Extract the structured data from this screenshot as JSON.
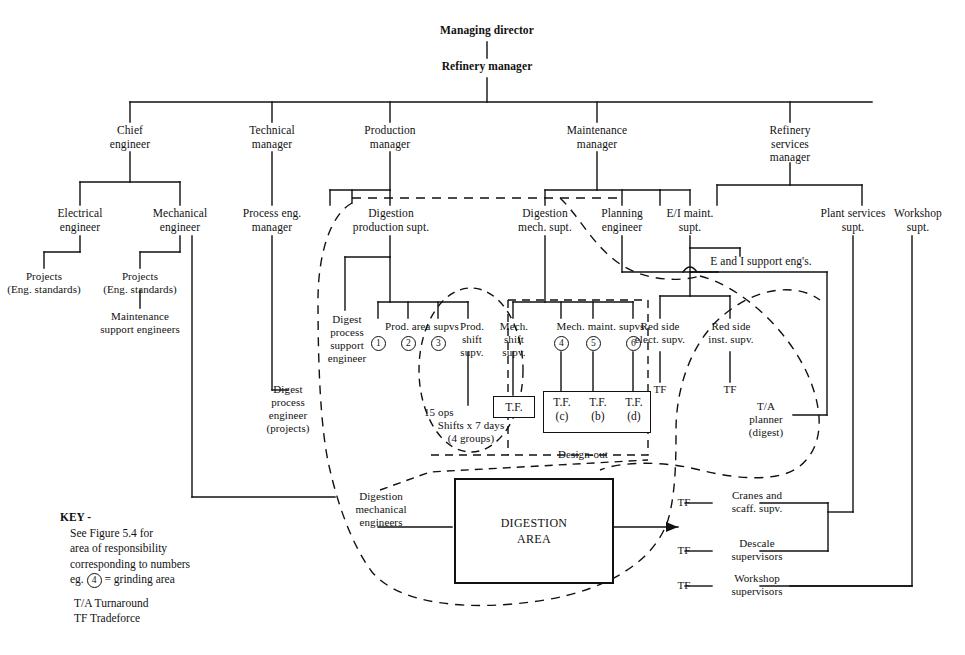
{
  "figure": {
    "top": [
      {
        "id": "managing-director",
        "label": "Managing director"
      },
      {
        "id": "refinery-manager",
        "label": "Refinery manager"
      }
    ],
    "managers": [
      {
        "id": "chief-engineer",
        "l1": "Chief",
        "l2": "engineer"
      },
      {
        "id": "technical-manager",
        "l1": "Technical",
        "l2": "manager"
      },
      {
        "id": "production-manager",
        "l1": "Production",
        "l2": "manager"
      },
      {
        "id": "maintenance-manager",
        "l1": "Maintenance",
        "l2": "manager"
      },
      {
        "id": "refinery-services-manager",
        "l1": "Refinery",
        "l2": "services",
        "l3": "manager"
      }
    ],
    "engineering": [
      {
        "id": "electrical-engineer",
        "l1": "Electrical",
        "l2": "engineer"
      },
      {
        "id": "mechanical-engineer",
        "l1": "Mechanical",
        "l2": "engineer"
      },
      {
        "id": "process-eng-manager",
        "l1": "Process eng.",
        "l2": "manager"
      }
    ],
    "projects": [
      {
        "id": "projects-electrical",
        "l1": "Projects",
        "l2": "(Eng. standards)"
      },
      {
        "id": "projects-mechanical",
        "l1": "Projects",
        "l2": "(Eng. standards)"
      }
    ],
    "maintenance_support": {
      "id": "maintenance-support-engineers",
      "l1": "Maintenance",
      "l2": "support engineers"
    },
    "digest_process_engineer_projects": {
      "l1": "Digest",
      "l2": "process",
      "l3": "engineer",
      "l4": "(projects)"
    },
    "supts": [
      {
        "id": "digestion-production-supt",
        "l1": "Digestion",
        "l2": "production supt."
      },
      {
        "id": "digestion-mech-supt",
        "l1": "Digestion",
        "l2": "mech. supt."
      },
      {
        "id": "planning-engineer",
        "l1": "Planning",
        "l2": "engineer"
      },
      {
        "id": "ei-maint-supt",
        "l1": "E/I maint.",
        "l2": "supt."
      },
      {
        "id": "plant-services-supt",
        "l1": "Plant services",
        "l2": "supt."
      },
      {
        "id": "workshop-supt",
        "l1": "Workshop",
        "l2": "supt."
      }
    ],
    "e_and_i_support": {
      "id": "e-and-i-support-engs",
      "label": "E and I support eng's."
    },
    "digest_process_support_engineer": {
      "l1": "Digest",
      "l2": "process",
      "l3": "support",
      "l4": "engineer"
    },
    "prod_area_supvs": {
      "label": "Prod. area supvs",
      "numbers": [
        "1",
        "2",
        "3"
      ]
    },
    "mech_maint_supvs": {
      "label": "Mech. maint. supvs",
      "numbers": [
        "4",
        "5",
        "6"
      ]
    },
    "prod_shift_supv": {
      "l1": "Prod.",
      "l2": "shift",
      "l3": "supv."
    },
    "mech_shift_supv": {
      "l1": "Mech.",
      "l2": "shift",
      "l3": "supv."
    },
    "ops_note": {
      "l1": "15 ops",
      "l2": "Shifts x 7 days",
      "l3": "(4 groups)"
    },
    "tf_single": {
      "label": "T.F."
    },
    "tf_group": [
      {
        "top": "T.F.",
        "bottom": "(c)"
      },
      {
        "top": "T.F.",
        "bottom": "(b)"
      },
      {
        "top": "T.F.",
        "bottom": "(d)"
      }
    ],
    "design_out": {
      "label": "Design-out"
    },
    "red_side": [
      {
        "id": "red-side-elect-supv",
        "l1": "Red side",
        "l2": "elect. supv.",
        "tf": "TF"
      },
      {
        "id": "red-side-inst-supv",
        "l1": "Red side",
        "l2": "inst. supv.",
        "tf": "TF"
      }
    ],
    "ta_planner": {
      "l1": "T/A",
      "l2": "planner",
      "l3": "(digest)"
    },
    "digestion_mech_engineers": {
      "l1": "Digestion",
      "l2": "mechanical",
      "l3": "engineers"
    },
    "digestion_area": {
      "l1": "DIGESTION",
      "l2": "AREA"
    },
    "services_rows": [
      {
        "id": "cranes-and-scaff-supv",
        "tf": "TF",
        "l1": "Cranes and",
        "l2": "scaff. supv."
      },
      {
        "id": "descale-supervisors",
        "tf": "TF",
        "l1": "Descale",
        "l2": "supervisors"
      },
      {
        "id": "workshop-supervisors",
        "tf": "TF",
        "l1": "Workshop",
        "l2": "supervisors"
      }
    ],
    "key": {
      "title": "KEY -",
      "line1": "See Figure 5.4 for",
      "line2": "area of responsibility",
      "line3": "corresponding to numbers",
      "line4_prefix": "eg.",
      "line4_circle": "4",
      "line4_suffix": "= grinding area",
      "line5": "T/A  Turnaround",
      "line6": "TF  Tradeforce"
    }
  }
}
